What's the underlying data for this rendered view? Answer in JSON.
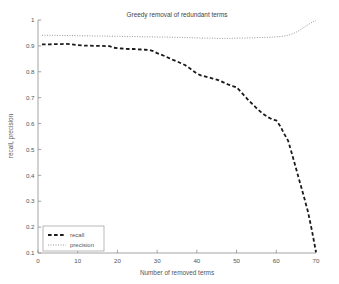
{
  "chart_data": {
    "type": "line",
    "title": "Greedy removal of redundant terms",
    "xlabel": "Number of removed terms",
    "ylabel": "recall, precision",
    "xlim": [
      0,
      70
    ],
    "ylim": [
      0.1,
      1
    ],
    "xticks": [
      0,
      10,
      20,
      30,
      40,
      50,
      60,
      70
    ],
    "xtick_labels": [
      "0",
      "10",
      "20",
      "30",
      "40",
      "50",
      "60",
      "70"
    ],
    "yticks": [
      0.1,
      0.2,
      0.3,
      0.4,
      0.5,
      0.6,
      0.7,
      0.8,
      0.9,
      1
    ],
    "ytick_labels": [
      "0.1",
      "0.2",
      "0.3",
      "0.4",
      "0.5",
      "0.6",
      "0.7",
      "0.8",
      "0.9",
      "1"
    ],
    "grid": false,
    "legend_position": "lower left",
    "series": [
      {
        "name": "recall",
        "style": "dashed",
        "color": "#1a1a1a",
        "width": 1.8,
        "x": [
          1,
          2,
          3,
          4,
          5,
          6,
          7,
          8,
          9,
          10,
          11,
          12,
          13,
          14,
          15,
          16,
          17,
          18,
          19,
          20,
          21,
          22,
          23,
          24,
          25,
          26,
          27,
          28,
          29,
          30,
          31,
          32,
          33,
          34,
          35,
          36,
          37,
          38,
          39,
          40,
          41,
          42,
          43,
          44,
          45,
          46,
          47,
          48,
          49,
          50,
          51,
          52,
          53,
          54,
          55,
          56,
          57,
          58,
          59,
          60,
          61,
          62,
          63,
          64,
          65,
          66,
          67,
          68,
          69,
          70
        ],
        "values": [
          0.906,
          0.906,
          0.906,
          0.907,
          0.907,
          0.907,
          0.908,
          0.907,
          0.905,
          0.903,
          0.902,
          0.901,
          0.901,
          0.9,
          0.9,
          0.9,
          0.899,
          0.899,
          0.893,
          0.891,
          0.89,
          0.889,
          0.888,
          0.888,
          0.887,
          0.886,
          0.885,
          0.884,
          0.88,
          0.872,
          0.866,
          0.86,
          0.853,
          0.846,
          0.84,
          0.833,
          0.826,
          0.816,
          0.804,
          0.793,
          0.786,
          0.782,
          0.778,
          0.774,
          0.77,
          0.764,
          0.757,
          0.75,
          0.745,
          0.74,
          0.724,
          0.707,
          0.69,
          0.675,
          0.66,
          0.646,
          0.634,
          0.624,
          0.616,
          0.612,
          0.59,
          0.56,
          0.533,
          0.48,
          0.425,
          0.37,
          0.315,
          0.258,
          0.185,
          0.103
        ]
      },
      {
        "name": "precision",
        "style": "dotted",
        "color": "#9a9a9a",
        "width": 1.0,
        "x": [
          1,
          2,
          3,
          4,
          5,
          6,
          7,
          8,
          9,
          10,
          11,
          12,
          13,
          14,
          15,
          16,
          17,
          18,
          19,
          20,
          21,
          22,
          23,
          24,
          25,
          26,
          27,
          28,
          29,
          30,
          31,
          32,
          33,
          34,
          35,
          36,
          37,
          38,
          39,
          40,
          41,
          42,
          43,
          44,
          45,
          46,
          47,
          48,
          49,
          50,
          51,
          52,
          53,
          54,
          55,
          56,
          57,
          58,
          59,
          60,
          61,
          62,
          63,
          64,
          65,
          66,
          67,
          68,
          69,
          70
        ],
        "values": [
          0.941,
          0.941,
          0.941,
          0.941,
          0.94,
          0.94,
          0.94,
          0.94,
          0.94,
          0.939,
          0.939,
          0.939,
          0.939,
          0.938,
          0.938,
          0.938,
          0.938,
          0.937,
          0.937,
          0.937,
          0.937,
          0.936,
          0.936,
          0.936,
          0.936,
          0.935,
          0.935,
          0.935,
          0.935,
          0.934,
          0.934,
          0.934,
          0.934,
          0.933,
          0.933,
          0.933,
          0.932,
          0.932,
          0.931,
          0.931,
          0.93,
          0.93,
          0.93,
          0.93,
          0.929,
          0.929,
          0.929,
          0.929,
          0.929,
          0.93,
          0.93,
          0.93,
          0.931,
          0.931,
          0.932,
          0.932,
          0.933,
          0.933,
          0.934,
          0.935,
          0.936,
          0.938,
          0.941,
          0.946,
          0.953,
          0.962,
          0.972,
          0.982,
          0.991,
          0.998
        ]
      }
    ],
    "legend_entries": [
      {
        "label": "recall",
        "style": "dashed",
        "color": "#1a1a1a"
      },
      {
        "label": "precision",
        "style": "dotted",
        "color": "#9a9a9a"
      }
    ]
  }
}
